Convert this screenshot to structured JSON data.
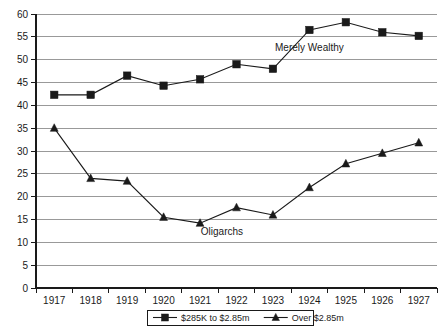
{
  "chart_data": {
    "type": "line",
    "title": "",
    "xlabel": "",
    "ylabel": "",
    "ylim": [
      0,
      60
    ],
    "ytick_step": 5,
    "grid": true,
    "legend_position": "bottom",
    "categories": [
      "1917",
      "1918",
      "1919",
      "1920",
      "1921",
      "1922",
      "1923",
      "1924",
      "1925",
      "1926",
      "1927"
    ],
    "yticks": [
      "0",
      "5",
      "10",
      "15",
      "20",
      "25",
      "30",
      "35",
      "40",
      "45",
      "50",
      "55",
      "60"
    ],
    "series": [
      {
        "name": "$285K to $2.85m",
        "marker": "square",
        "color": "#1a1a1a",
        "annotation": "Merely Wealthy",
        "values": [
          42.3,
          42.3,
          46.5,
          44.3,
          45.7,
          49.0,
          48.0,
          56.5,
          58.2,
          56.0,
          55.2
        ]
      },
      {
        "name": "Over $2.85m",
        "marker": "triangle",
        "color": "#1a1a1a",
        "annotation": "Oligarchs",
        "values": [
          35.0,
          24.0,
          23.4,
          15.5,
          14.2,
          17.6,
          16.0,
          22.0,
          27.2,
          29.5,
          31.8
        ]
      }
    ],
    "annotations": [
      {
        "text": "Merely Wealthy",
        "x": 1924.0,
        "y": 52.0
      },
      {
        "text": "Oligarchs",
        "x": 1921.6,
        "y": 11.5
      }
    ]
  },
  "legend": {
    "entries": [
      {
        "label": "$285K to $2.85m",
        "marker": "square"
      },
      {
        "label": "Over $2.85m",
        "marker": "triangle"
      }
    ]
  }
}
